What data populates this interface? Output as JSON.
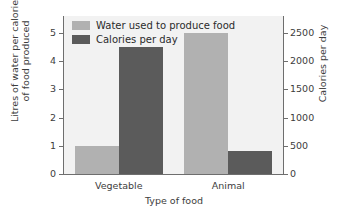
{
  "chart_data": {
    "type": "bar",
    "title": "",
    "xlabel": "Type of food",
    "categories": [
      "Vegetable",
      "Animal"
    ],
    "grid": false,
    "legend_position": "top-left",
    "series": [
      {
        "name": "Water used to produce food",
        "axis": "left",
        "color": "#b1b1b1",
        "unit": "Litres of water per calorie of food produced",
        "values": [
          1.0,
          5.0
        ]
      },
      {
        "name": "Calories per day",
        "axis": "right",
        "color": "#5b5b5b",
        "unit": "Calories per day",
        "values": [
          2250,
          400
        ]
      }
    ],
    "left_axis": {
      "label_line1": "Litres of water per calorie",
      "label_line2": "of food produced",
      "ticks": [
        "0",
        "1",
        "2",
        "3",
        "4",
        "5"
      ],
      "ylim": [
        0,
        5.6
      ]
    },
    "right_axis": {
      "label": "Calories per day",
      "ticks": [
        "0",
        "500",
        "1000",
        "1500",
        "2000",
        "2500"
      ],
      "ylim": [
        0,
        2800
      ]
    }
  },
  "legend": {
    "items": [
      {
        "label": "Water used to produce food",
        "swatch": "water"
      },
      {
        "label": "Calories per day",
        "swatch": "cal"
      }
    ]
  },
  "colors": {
    "water_bar": "#b1b1b1",
    "calorie_bar": "#5b5b5b",
    "plot_background": "#f2f2f2",
    "axis": "#6e6e6e",
    "text": "#3d3d3d"
  }
}
